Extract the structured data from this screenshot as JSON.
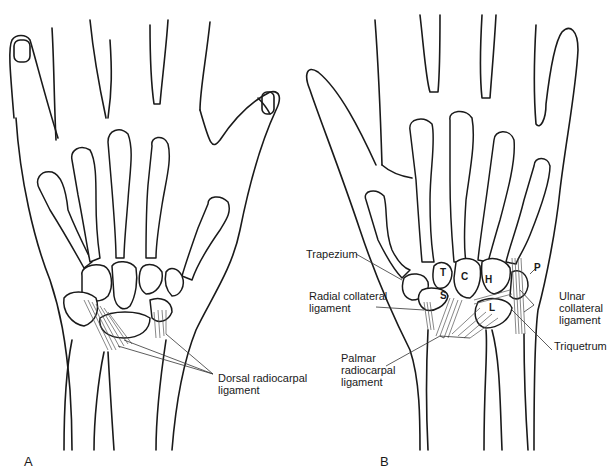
{
  "figure": {
    "panels": [
      {
        "id": "A",
        "label": "A",
        "view": "dorsal",
        "annotations": [
          {
            "text": "Dorsal radiocarpal\nligament"
          }
        ]
      },
      {
        "id": "B",
        "label": "B",
        "view": "palmar",
        "annotations": [
          {
            "text": "Trapezium"
          },
          {
            "text": "Radial collateral\nligament"
          },
          {
            "text": "Palmar\nradiocarpal\nligament"
          },
          {
            "text": "Ulnar\ncollateral\nligament"
          },
          {
            "text": "Triquetrum"
          }
        ],
        "bone_letters": [
          "T",
          "C",
          "H",
          "S",
          "L",
          "P"
        ]
      }
    ]
  }
}
